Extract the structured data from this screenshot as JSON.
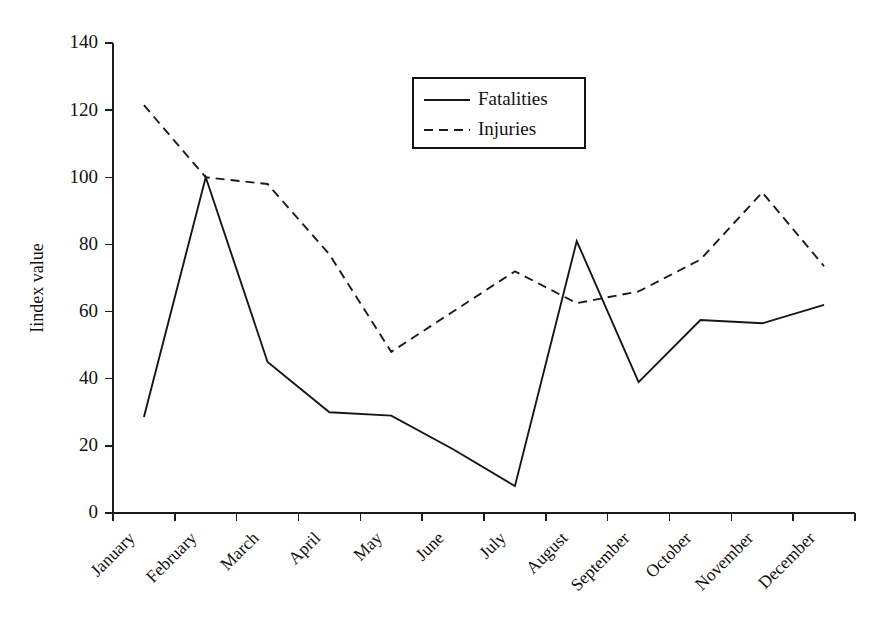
{
  "chart_data": {
    "type": "line",
    "title": "",
    "xlabel": "",
    "ylabel": "Iindex value",
    "ylim": [
      0,
      140
    ],
    "ytick_step": 20,
    "yticks": [
      0,
      20,
      40,
      60,
      80,
      100,
      120,
      140
    ],
    "grid": false,
    "legend_position": "top-center-right",
    "categories": [
      "January",
      "February",
      "March",
      "April",
      "May",
      "June",
      "July",
      "August",
      "September",
      "October",
      "November",
      "December"
    ],
    "series": [
      {
        "name": "Fatalities",
        "style": "solid",
        "color": "#161616",
        "values": [
          28.6,
          100,
          45,
          30,
          29,
          19,
          8,
          81,
          39,
          57.5,
          56.5,
          62
        ]
      },
      {
        "name": "Injuries",
        "style": "dashed",
        "color": "#1b1b1b",
        "values": [
          121.5,
          100,
          98,
          77,
          48,
          60,
          72,
          62.5,
          66,
          75.5,
          95.5,
          73.5
        ]
      }
    ]
  },
  "legend": {
    "entries": [
      {
        "label": "Fatalities",
        "style": "solid"
      },
      {
        "label": "Injuries",
        "style": "dashed"
      }
    ]
  },
  "axes": {
    "y_title": "Iindex value",
    "y_tick_labels": [
      "0",
      "20",
      "40",
      "60",
      "80",
      "100",
      "120",
      "140"
    ],
    "x_tick_labels": [
      "January",
      "February",
      "March",
      "April",
      "May",
      "June",
      "July",
      "August",
      "September",
      "October",
      "November",
      "December"
    ]
  },
  "colors": {
    "background": "#ffffff",
    "axis": "#1c1c1c",
    "fatalities": "#161616",
    "injuries": "#1b1b1b"
  }
}
